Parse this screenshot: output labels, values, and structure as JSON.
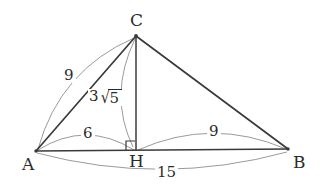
{
  "figure": {
    "type": "geometry-diagram",
    "background_color": "#ffffff",
    "stroke_color_solid": "#3a3a3a",
    "stroke_color_arc": "#8e8e8e",
    "text_color": "#2b2b2b"
  },
  "vertices": [
    {
      "id": "A",
      "label": "A",
      "x": 36,
      "y": 151,
      "label_x": 22,
      "label_y": 156
    },
    {
      "id": "B",
      "label": "B",
      "x": 288,
      "y": 149,
      "label_x": 293,
      "label_y": 154
    },
    {
      "id": "C",
      "label": "C",
      "x": 136,
      "y": 36,
      "label_x": 130,
      "label_y": 12
    },
    {
      "id": "H",
      "label": "H",
      "x": 136,
      "y": 150,
      "label_x": 129,
      "label_y": 153
    }
  ],
  "segments": [
    {
      "name": "side-AC",
      "from": "A",
      "to": "C"
    },
    {
      "name": "side-CB",
      "from": "C",
      "to": "B"
    },
    {
      "name": "base-AB",
      "from": "A",
      "to": "B"
    },
    {
      "name": "altitude-CH",
      "from": "C",
      "to": "H"
    }
  ],
  "right_angle": {
    "at": "H",
    "name": "right-angle-marker",
    "size": 9
  },
  "measures": [
    {
      "id": "AC",
      "name": "measure-arc-ac",
      "text": "9",
      "label_x": 62,
      "label_y": 68,
      "arc": {
        "x1": 38,
        "y1": 149,
        "x2": 134,
        "y2": 38,
        "cx": 60,
        "cy": 70
      }
    },
    {
      "id": "CH",
      "name": "measure-arc-ch",
      "coefficient": "3",
      "radical_sign": "√",
      "radicand": "5",
      "text": "3√5",
      "label_x": 88,
      "label_y": 89,
      "arc": {
        "x1": 135,
        "y1": 39,
        "x2": 133,
        "y2": 147,
        "cx": 108,
        "cy": 95
      }
    },
    {
      "id": "AH",
      "name": "measure-arc-ah",
      "text": "6",
      "label_x": 81,
      "label_y": 126,
      "arc": {
        "x1": 38,
        "y1": 150,
        "x2": 134,
        "y2": 150,
        "cx": 86,
        "cy": 120
      }
    },
    {
      "id": "HB",
      "name": "measure-arc-hb",
      "text": "9",
      "label_x": 207,
      "label_y": 124,
      "arc": {
        "x1": 138,
        "y1": 150,
        "x2": 286,
        "y2": 149,
        "cx": 212,
        "cy": 117
      }
    },
    {
      "id": "AB",
      "name": "measure-arc-ab",
      "text": "15",
      "label_x": 155,
      "label_y": 165,
      "arc": {
        "x1": 37,
        "y1": 153,
        "x2": 287,
        "y2": 152,
        "cx": 162,
        "cy": 186
      }
    }
  ]
}
